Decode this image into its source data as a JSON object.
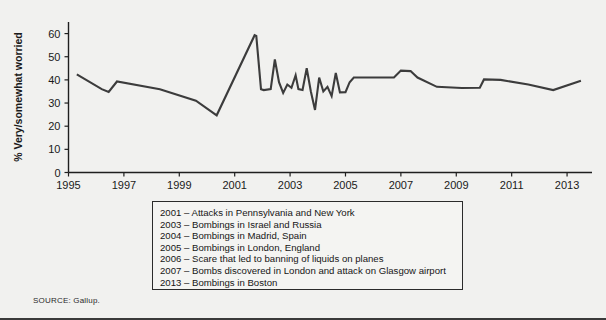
{
  "figure": {
    "source_note": "SOURCE: Gallup.",
    "background_color": "#f1f1ef",
    "line_color": "#3c3c3c",
    "axis_color": "#1f1f1f"
  },
  "annotations": {
    "items": [
      "2001 – Attacks in Pennsylvania and New York",
      "2003 – Bombings in Israel and Russia",
      "2004 – Bombings in Madrid, Spain",
      "2005 – Bombings in London, England",
      "2006 – Scare that led to banning of liquids on planes",
      "2007 – Bombs discovered in London and attack on Glasgow airport",
      "2013 – Bombings in Boston"
    ]
  },
  "chart_data": {
    "type": "line",
    "title": "",
    "xlabel": "",
    "ylabel": "% Very/somewhat worried",
    "xlim": [
      1995.0,
      2013.9
    ],
    "ylim": [
      0,
      65
    ],
    "yticks": [
      0,
      10,
      20,
      30,
      40,
      50,
      60
    ],
    "ytick_labels": [
      "0",
      "10",
      "20",
      "30",
      "40",
      "50",
      "60"
    ],
    "xticks": [
      1995,
      1997,
      1999,
      2001,
      2003,
      2005,
      2007,
      2009,
      2011,
      2013
    ],
    "xtick_labels": [
      "1995",
      "1997",
      "1999",
      "2001",
      "2003",
      "2005",
      "2007",
      "2009",
      "2011",
      "2013"
    ],
    "grid": false,
    "legend": "none",
    "series": [
      {
        "name": "% Very/somewhat worried",
        "x": [
          1995.3,
          1996.2,
          1996.45,
          1996.75,
          1998.3,
          1999.6,
          2000.35,
          2001.72,
          2001.78,
          2001.95,
          2002.05,
          2002.3,
          2002.45,
          2002.6,
          2002.75,
          2002.9,
          2003.05,
          2003.2,
          2003.3,
          2003.45,
          2003.6,
          2003.75,
          2003.9,
          2004.05,
          2004.2,
          2004.35,
          2004.5,
          2004.65,
          2004.8,
          2005.0,
          2005.15,
          2005.3,
          2005.55,
          2005.9,
          2006.4,
          2006.75,
          2007.0,
          2007.35,
          2007.6,
          2008.3,
          2009.2,
          2009.85,
          2010.0,
          2010.6,
          2011.6,
          2012.5,
          2013.5
        ],
        "y": [
          42.4,
          36.0,
          34.8,
          39.3,
          36.0,
          31.0,
          24.7,
          59.3,
          59.0,
          36.0,
          35.6,
          36.0,
          48.8,
          39.0,
          34.4,
          38.0,
          36.6,
          42.0,
          36.0,
          35.6,
          45.0,
          35.0,
          27.0,
          41.0,
          35.0,
          37.0,
          33.0,
          43.0,
          34.6,
          34.7,
          39.0,
          41.0,
          41.0,
          41.0,
          41.0,
          41.0,
          44.0,
          43.8,
          41.0,
          37.0,
          36.5,
          36.6,
          40.2,
          40.0,
          38.0,
          35.6,
          39.6
        ]
      }
    ]
  }
}
